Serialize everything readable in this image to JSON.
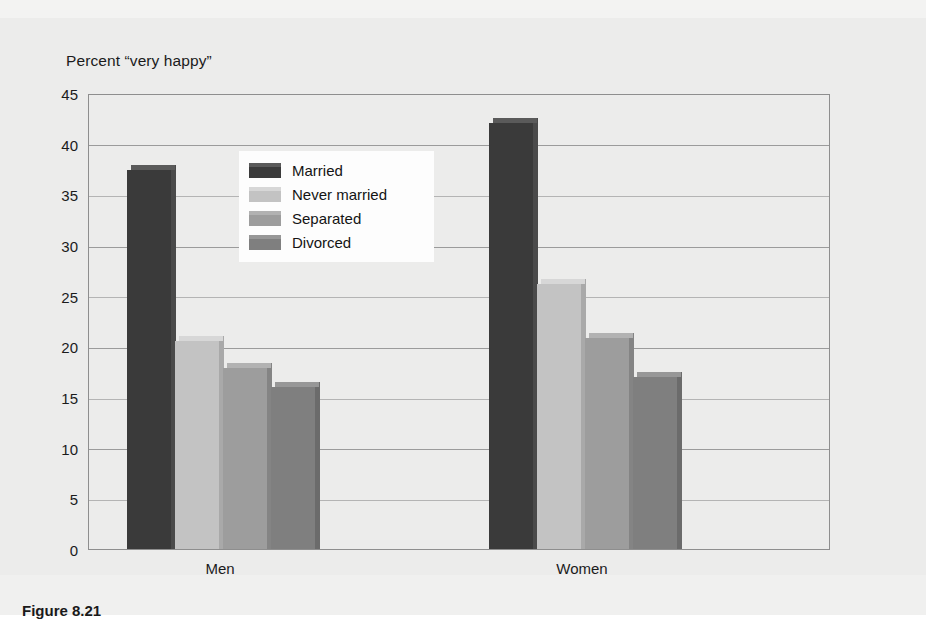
{
  "figure": {
    "axis_title": "Percent “very happy”",
    "caption": "Figure 8.21"
  },
  "colors": {
    "married": "#3a3a3a",
    "never_married": "#c3c3c3",
    "separated": "#9d9d9d",
    "divorced": "#7f7f7f",
    "married_top": "#5a5a5a",
    "never_married_top": "#d7d7d7",
    "separated_top": "#b2b2b2",
    "divorced_top": "#979797",
    "married_side": "#4a4a4a",
    "never_married_side": "#a9a9a9",
    "separated_side": "#848484",
    "divorced_side": "#6b6b6b",
    "plot_background": "#ececeb",
    "grid": "#9b9b9b",
    "frame": "#8e8e8e"
  },
  "chart_data": {
    "type": "bar",
    "title": "",
    "subtitle": "",
    "xlabel": "",
    "ylabel": "Percent “very happy”",
    "categories": [
      "Men",
      "Women"
    ],
    "series": [
      {
        "name": "Married",
        "values": [
          37.4,
          42.0
        ]
      },
      {
        "name": "Never married",
        "values": [
          20.5,
          26.2
        ]
      },
      {
        "name": "Separated",
        "values": [
          17.9,
          20.8
        ]
      },
      {
        "name": "Divorced",
        "values": [
          16.0,
          17.0
        ]
      }
    ],
    "ylim": [
      0,
      45
    ],
    "yticks": [
      0,
      5,
      10,
      15,
      20,
      25,
      30,
      35,
      40,
      45
    ],
    "ytick_labels": [
      "0",
      "5",
      "10",
      "15",
      "20",
      "25",
      "30",
      "35",
      "40",
      "45"
    ],
    "grid": true,
    "grid_axis": "y",
    "legend_position": "inside-upper-center",
    "legend_entries": [
      "Married",
      "Never married",
      "Separated",
      "Divorced"
    ],
    "annotations": []
  },
  "legend": {
    "items": [
      {
        "label": "Married"
      },
      {
        "label": "Never married"
      },
      {
        "label": "Separated"
      },
      {
        "label": "Divorced"
      }
    ]
  },
  "axis": {
    "x_labels": [
      {
        "text": "Men"
      },
      {
        "text": "Women"
      }
    ]
  }
}
